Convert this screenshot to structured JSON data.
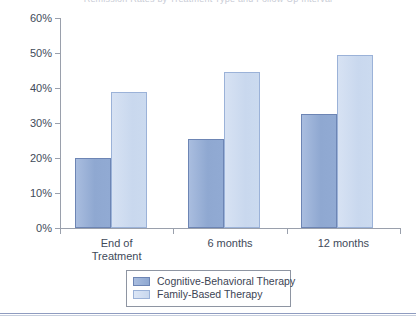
{
  "figure": {
    "title_cutoff": "Remission Rates by Treatment Type and Follow-Up Interval",
    "background_color": "#ffffff"
  },
  "chart_data": {
    "type": "bar",
    "title": "",
    "xlabel": "",
    "ylabel": "",
    "categories": [
      "End of\nTreatment",
      "6 months",
      "12 months"
    ],
    "category_labels": [
      {
        "line1": "End of",
        "line2": "Treatment"
      },
      {
        "line1": "6 months",
        "line2": ""
      },
      {
        "line1": "12 months",
        "line2": ""
      }
    ],
    "series": [
      {
        "name": "Cognitive-Behavioral Therapy",
        "color": "#8fa8d1",
        "border_color": "#6d85b4",
        "values": [
          20,
          25.5,
          32.5
        ]
      },
      {
        "name": "Family-Based Therapy",
        "color": "#cbdaef",
        "border_color": "#9bb2d8",
        "values": [
          39,
          44.5,
          49.5
        ]
      }
    ],
    "ylim": [
      0,
      60
    ],
    "ytick_values": [
      0,
      10,
      20,
      30,
      40,
      50,
      60
    ],
    "ytick_labels": [
      "0%",
      "10%",
      "20%",
      "30%",
      "40%",
      "50%",
      "60%"
    ],
    "grid": false,
    "legend_position": "bottom-center"
  },
  "legend": {
    "items": [
      {
        "label": "Cognitive-Behavioral Therapy",
        "swatch": "cbt"
      },
      {
        "label": "Family-Based Therapy",
        "swatch": "fbt"
      }
    ]
  }
}
